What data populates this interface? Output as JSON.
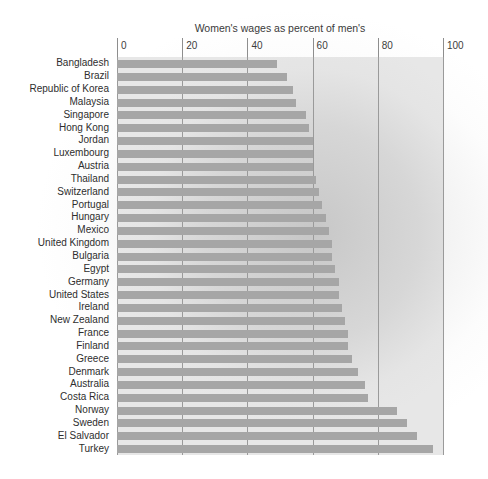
{
  "chart_data": {
    "type": "bar",
    "orientation": "horizontal",
    "title": "Women's wages as percent of men's",
    "xlabel": "",
    "ylabel": "",
    "xlim": [
      0,
      100
    ],
    "xticks": [
      0,
      20,
      40,
      60,
      80,
      100
    ],
    "xtick_labels": [
      "0",
      "20",
      "40",
      "60",
      "80",
      "100"
    ],
    "grid": true,
    "legend": false,
    "bar_color": "#a6a6a6",
    "plot_background": "#e7e7e7",
    "categories": [
      "Bangladesh",
      "Brazil",
      "Republic of Korea",
      "Malaysia",
      "Singapore",
      "Hong Kong",
      "Jordan",
      "Luxembourg",
      "Austria",
      "Thailand",
      "Switzerland",
      "Portugal",
      "Hungary",
      "Mexico",
      "United Kingdom",
      "Bulgaria",
      "Egypt",
      "Germany",
      "United States",
      "Ireland",
      "New Zealand",
      "France",
      "Finland",
      "Greece",
      "Denmark",
      "Australia",
      "Costa Rica",
      "Norway",
      "Sweden",
      "El Salvador",
      "Turkey"
    ],
    "values": [
      49,
      52,
      54,
      55,
      58,
      59,
      60,
      60,
      60,
      61,
      62,
      63,
      64,
      65,
      66,
      66,
      67,
      68,
      68,
      69,
      70,
      71,
      71,
      72,
      74,
      76,
      77,
      86,
      89,
      92,
      97
    ]
  }
}
